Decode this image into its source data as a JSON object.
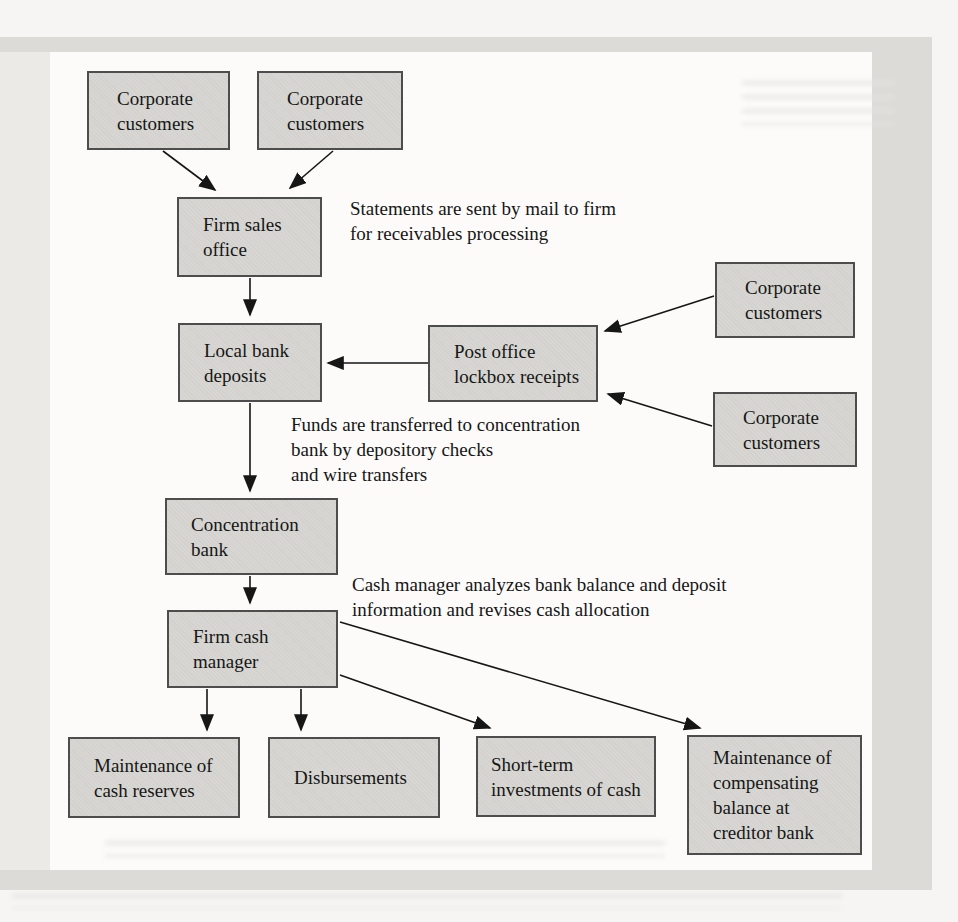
{
  "figure": {
    "type": "flowchart",
    "nodes": {
      "cc_top_left": {
        "label": "Corporate\ncustomers"
      },
      "cc_top_mid": {
        "label": "Corporate\ncustomers"
      },
      "cc_right_upper": {
        "label": "Corporate\ncustomers"
      },
      "cc_right_lower": {
        "label": "Corporate\ncustomers"
      },
      "firm_sales_office": {
        "label": "Firm sales\noffice"
      },
      "local_bank_deposits": {
        "label": "Local bank\ndeposits"
      },
      "post_office_lockbox": {
        "label": "Post office\nlockbox receipts"
      },
      "concentration_bank": {
        "label": "Concentration\nbank"
      },
      "firm_cash_manager": {
        "label": "Firm cash\nmanager"
      },
      "cash_reserves": {
        "label": "Maintenance of\ncash reserves"
      },
      "disbursements": {
        "label": "Disbursements"
      },
      "short_term_investments": {
        "label": "Short-term\ninvestments of cash"
      },
      "compensating_balance": {
        "label": "Maintenance of\ncompensating\nbalance at\ncreditor bank"
      }
    },
    "annotations": {
      "statements": "Statements are sent by mail to firm\nfor receivables processing",
      "funds_transfer": "Funds are transferred to concentration\nbank by depository checks\nand wire transfers",
      "cash_manager_note": "Cash manager analyzes bank balance and deposit\ninformation and revises cash allocation"
    },
    "edges": [
      {
        "from": "cc_top_left",
        "to": "firm_sales_office"
      },
      {
        "from": "cc_top_mid",
        "to": "firm_sales_office"
      },
      {
        "from": "firm_sales_office",
        "to": "local_bank_deposits"
      },
      {
        "from": "post_office_lockbox",
        "to": "local_bank_deposits"
      },
      {
        "from": "cc_right_upper",
        "to": "post_office_lockbox"
      },
      {
        "from": "cc_right_lower",
        "to": "post_office_lockbox"
      },
      {
        "from": "local_bank_deposits",
        "to": "concentration_bank"
      },
      {
        "from": "concentration_bank",
        "to": "firm_cash_manager"
      },
      {
        "from": "firm_cash_manager",
        "to": "cash_reserves"
      },
      {
        "from": "firm_cash_manager",
        "to": "disbursements"
      },
      {
        "from": "firm_cash_manager",
        "to": "short_term_investments"
      },
      {
        "from": "firm_cash_manager",
        "to": "compensating_balance"
      }
    ],
    "colors": {
      "box_fill": "#d7d6d2",
      "box_border": "#4d4d4d",
      "mat": "#dcdbd8",
      "panel": "#fcfbf9",
      "arrow": "#161616"
    }
  }
}
